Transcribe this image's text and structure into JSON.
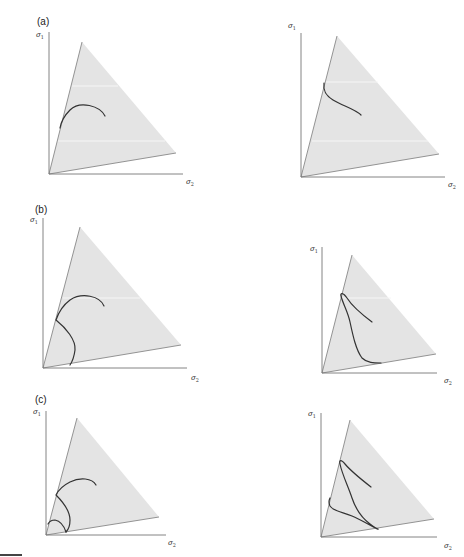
{
  "figure": {
    "panels": [
      {
        "id": "a",
        "label": "(a)"
      },
      {
        "id": "b",
        "label": "(b)"
      },
      {
        "id": "c",
        "label": "(c)"
      }
    ],
    "axes": {
      "y_symbol": "σ",
      "y_subscript": "1",
      "x_symbol": "σ",
      "x_subscript": "2"
    },
    "colors": {
      "triangle_fill": "#e4e4e4",
      "axis": "#777777",
      "trajectory": "#333333",
      "background": "#ffffff"
    },
    "subplots": [
      {
        "row": "a",
        "col": "left",
        "description": "single arc trajectory on stress-space triangle"
      },
      {
        "row": "a",
        "col": "right",
        "description": "single S-shaped trajectory on stress-space triangle"
      },
      {
        "row": "b",
        "col": "left",
        "description": "arc trajectory reflecting off triangle edge to lower edge"
      },
      {
        "row": "b",
        "col": "right",
        "description": "looping trajectory reflecting twice"
      },
      {
        "row": "c",
        "col": "left",
        "description": "nested arcs with multiple reflections"
      },
      {
        "row": "c",
        "col": "right",
        "description": "looping trajectory with multiple reflections"
      }
    ]
  }
}
